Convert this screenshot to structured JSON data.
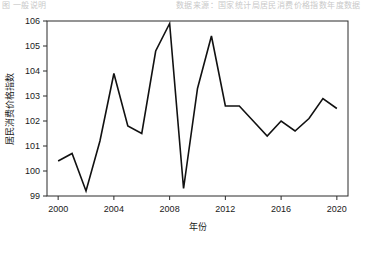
{
  "page": {
    "background": "#ffffff",
    "bleed_text_left": "图 一般说明",
    "bleed_text_right": "数据来源：国家统计局居民消费价格指数年度数据"
  },
  "chart_data": {
    "type": "line",
    "title": "",
    "xlabel": "年份",
    "ylabel": "居民消费价格指数",
    "x": [
      2000,
      2001,
      2002,
      2003,
      2004,
      2005,
      2006,
      2007,
      2008,
      2009,
      2010,
      2011,
      2012,
      2013,
      2014,
      2015,
      2016,
      2017,
      2018,
      2019,
      2020
    ],
    "values": [
      100.4,
      100.7,
      99.2,
      101.2,
      103.9,
      101.8,
      101.5,
      104.8,
      105.9,
      99.3,
      103.3,
      105.4,
      102.6,
      102.6,
      102.0,
      101.4,
      102.0,
      101.6,
      102.1,
      102.9,
      102.5
    ],
    "series": [
      {
        "name": "居民消费价格指数",
        "color": "#111111",
        "values": [
          100.4,
          100.7,
          99.2,
          101.2,
          103.9,
          101.8,
          101.5,
          104.8,
          105.9,
          99.3,
          103.3,
          105.4,
          102.6,
          102.6,
          102.0,
          101.4,
          102.0,
          101.6,
          102.1,
          102.9,
          102.5
        ]
      }
    ],
    "xlim": [
      1999.2,
      2020.8
    ],
    "ylim": [
      99,
      106
    ],
    "xticks": [
      2000,
      2004,
      2008,
      2012,
      2016,
      2020
    ],
    "xtick_labels": [
      "2000",
      "2004",
      "2008",
      "2012",
      "2016",
      "2020"
    ],
    "yticks": [
      99,
      100,
      101,
      102,
      103,
      104,
      105,
      106
    ],
    "ytick_labels": [
      "99",
      "100",
      "101",
      "102",
      "103",
      "104",
      "105",
      "106"
    ],
    "grid": false,
    "legend": "none",
    "line_color": "#111111",
    "axis_color": "#2b2b2b"
  }
}
